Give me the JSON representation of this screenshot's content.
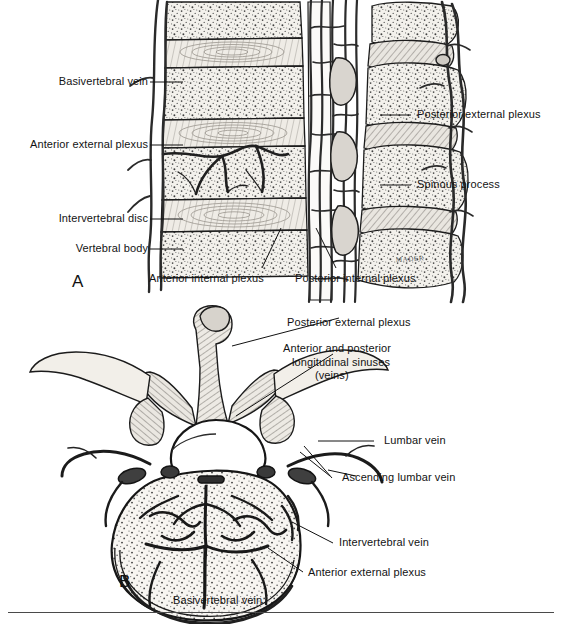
{
  "figure": {
    "artist_signature": "MADER",
    "background_color": "#ffffff",
    "ink_color": "#1a1a1a"
  },
  "panels": [
    {
      "letter": "A",
      "view": "sagittal section of lumbar vertebral column",
      "labels": [
        {
          "id": "a-basivertebral-vein",
          "text": "Basivertebral vein",
          "side": "left"
        },
        {
          "id": "a-anterior-external-plexus",
          "text": "Anterior external plexus",
          "side": "left"
        },
        {
          "id": "a-intervertebral-disc",
          "text": "Intervertebral disc",
          "side": "left"
        },
        {
          "id": "a-vertebral-body",
          "text": "Vertebral body",
          "side": "left"
        },
        {
          "id": "a-posterior-external-plexus",
          "text": "Posterior external plexus",
          "side": "right"
        },
        {
          "id": "a-spinous-process",
          "text": "Spinous process",
          "side": "right"
        },
        {
          "id": "a-anterior-internal-plexus",
          "text": "Anterior internal plexus",
          "side": "bottom"
        },
        {
          "id": "a-posterior-internal-plexus",
          "text": "Posterior internal plexus",
          "side": "bottom"
        }
      ]
    },
    {
      "letter": "B",
      "view": "superior (axial) view of a lumbar vertebra",
      "labels": [
        {
          "id": "b-posterior-external-plexus",
          "text": "Posterior external plexus",
          "side": "right"
        },
        {
          "id": "b-longitudinal-sinuses-1",
          "text": "Anterior and posterior",
          "side": "right"
        },
        {
          "id": "b-longitudinal-sinuses-2",
          "text": "longitudinal sinuses",
          "side": "right"
        },
        {
          "id": "b-longitudinal-sinuses-3",
          "text": "(veins)",
          "side": "right"
        },
        {
          "id": "b-lumbar-vein",
          "text": "Lumbar vein",
          "side": "right"
        },
        {
          "id": "b-ascending-lumbar-vein",
          "text": "Ascending lumbar vein",
          "side": "right"
        },
        {
          "id": "b-intervertebral-vein",
          "text": "Intervertebral vein",
          "side": "right"
        },
        {
          "id": "b-anterior-external-plexus",
          "text": "Anterior external plexus",
          "side": "bottom"
        },
        {
          "id": "b-basivertebral-vein",
          "text": "Basivertebral vein",
          "side": "bottom"
        }
      ]
    }
  ],
  "labels_flat": {
    "basivertebral_vein": "Basivertebral vein",
    "anterior_external_plexus": "Anterior external plexus",
    "intervertebral_disc": "Intervertebral disc",
    "vertebral_body": "Vertebral body",
    "posterior_external_plexus": "Posterior external plexus",
    "spinous_process": "Spinous process",
    "anterior_internal_plexus": "Anterior internal plexus",
    "posterior_internal_plexus": "Posterior internal plexus",
    "longitudinal_sinuses_line1": "Anterior and posterior",
    "longitudinal_sinuses_line2": "longitudinal sinuses",
    "longitudinal_sinuses_line3": "(veins)",
    "lumbar_vein": "Lumbar vein",
    "ascending_lumbar_vein": "Ascending lumbar vein",
    "intervertebral_vein": "Intervertebral vein",
    "panel_a_letter": "A",
    "panel_b_letter": "B",
    "signature": "MADER"
  }
}
